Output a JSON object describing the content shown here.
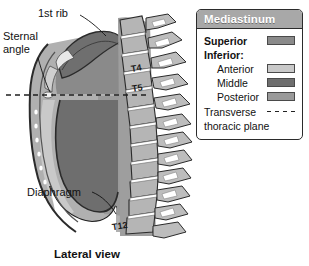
{
  "figure": {
    "caption": "Lateral view",
    "labels": {
      "first_rib": "1st rib",
      "sternal_angle_line1": "Sternal",
      "sternal_angle_line2": "angle",
      "diaphragm": "Diaphragm"
    },
    "vertebrae": [
      {
        "name": "T4"
      },
      {
        "name": "T5"
      },
      {
        "name": "T12"
      }
    ],
    "colors": {
      "thorax_outline": "#2b2b2b",
      "superior_mediastinum": "#8a8a8a",
      "anterior_mediastinum": "#c9c9c9",
      "middle_mediastinum": "#6e6e6e",
      "posterior_mediastinum": "#9a9a9a",
      "bone": "#b5b5b5",
      "lung_field": "#b0b0b0",
      "first_rib_fill": "#6f6f6f",
      "sternum_highlight": "#e8e8e8",
      "transverse_plane": "#222222"
    }
  },
  "legend": {
    "title": "Mediastinum",
    "superior": {
      "label": "Superior",
      "color": "#8a8a8a"
    },
    "inferior_heading": "Inferior:",
    "inferior_items": [
      {
        "label": "Anterior",
        "color": "#c9c9c9"
      },
      {
        "label": "Middle",
        "color": "#6e6e6e"
      },
      {
        "label": "Posterior",
        "color": "#9a9a9a"
      }
    ],
    "plane": {
      "line1": "Transverse",
      "line2": "thoracic plane",
      "style": "dashed"
    }
  }
}
